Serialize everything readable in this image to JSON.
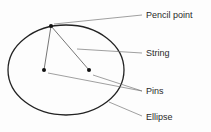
{
  "diagram": {
    "labels": {
      "pencil_point": "Pencil point",
      "string": "String",
      "pins": "Pins",
      "ellipse": "Ellipse"
    },
    "colors": {
      "ellipse_stroke": "#222222",
      "string": "#666666",
      "leader": "#777777",
      "point": "#111111"
    }
  }
}
